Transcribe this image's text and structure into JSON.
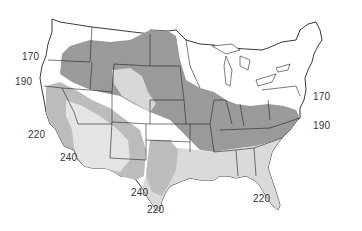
{
  "map": {
    "subject": "Contiguous United States with shaded zones",
    "zone_labels": [
      {
        "id": "w170",
        "text": "170",
        "x": 22,
        "y": 57
      },
      {
        "id": "w190",
        "text": "190",
        "x": 15,
        "y": 82
      },
      {
        "id": "w220",
        "text": "220",
        "x": 28,
        "y": 135
      },
      {
        "id": "sw240",
        "text": "240",
        "x": 60,
        "y": 158
      },
      {
        "id": "tx240",
        "text": "240",
        "x": 131,
        "y": 193
      },
      {
        "id": "tx220",
        "text": "220",
        "x": 147,
        "y": 210
      },
      {
        "id": "fl220",
        "text": "220",
        "x": 253,
        "y": 199
      },
      {
        "id": "e170",
        "text": "170",
        "x": 313,
        "y": 97
      },
      {
        "id": "e190",
        "text": "190",
        "x": 313,
        "y": 126
      }
    ],
    "colors": {
      "background": "#ffffff",
      "zone_dark": "#9a9a9a",
      "zone_medium": "#bcbcbc",
      "zone_light": "#dcdcdc",
      "zone_lightest": "#e9e9e9",
      "border": "#222222",
      "label": "#333333"
    }
  }
}
